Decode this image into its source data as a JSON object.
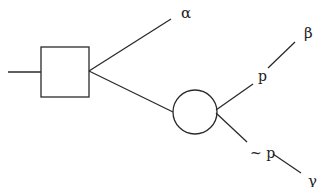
{
  "diagram": {
    "type": "decision-tree",
    "nodes": {
      "decision": {
        "shape": "square",
        "label": ""
      },
      "chance": {
        "shape": "circle",
        "label": ""
      }
    },
    "outcomes": {
      "alpha": "α",
      "beta": "β",
      "gamma": "γ"
    },
    "branch_labels": {
      "p": "p",
      "not_p": "~ p"
    },
    "colors": {
      "stroke": "#2a2a2a",
      "background": "#ffffff"
    }
  }
}
